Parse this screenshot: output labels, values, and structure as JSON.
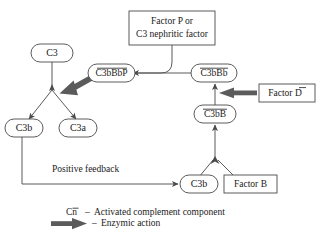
{
  "diagram": {
    "colors": {
      "node_stroke": "#4a4a4a",
      "edge_stroke": "#5a5a5a",
      "enzyme_arrow": "#5b5b5b",
      "text": "#1a1a1a",
      "background": "#ffffff"
    },
    "nodes": {
      "factor_p": {
        "label_line1": "Factor P or",
        "label_line2": "C3 nephritic factor",
        "shape": "rect"
      },
      "c3": {
        "label": "C3",
        "shape": "rounded"
      },
      "c3bbbp": {
        "label": "C3bBbP",
        "shape": "rounded",
        "overbar": true
      },
      "c3bbb": {
        "label": "C3bBb",
        "shape": "rounded",
        "overbar": true
      },
      "factor_d": {
        "label_prefix": "Factor ",
        "label_bar": "D",
        "shape": "rect",
        "overbar": true
      },
      "c3bb": {
        "label": "C3bB",
        "shape": "rounded",
        "overbar": true
      },
      "c3b_left": {
        "label": "C3b",
        "shape": "rounded"
      },
      "c3a": {
        "label": "C3a",
        "shape": "rounded"
      },
      "c3b_bottom": {
        "label": "C3b",
        "shape": "rounded"
      },
      "factor_b": {
        "label": "Factor B",
        "shape": "rect"
      }
    },
    "annotations": {
      "positive_feedback": "Positive feedback"
    },
    "legend": {
      "items": [
        {
          "symbol": "Cn",
          "symbol_bar": "n",
          "dash": "–",
          "text": "Activated complement component",
          "marker": "text"
        },
        {
          "symbol": "",
          "dash": "–",
          "text": "Enzymic action",
          "marker": "thick-arrow"
        }
      ]
    }
  }
}
